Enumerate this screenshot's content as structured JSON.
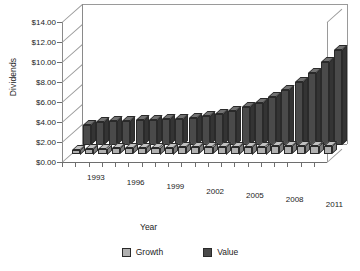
{
  "chart_data": {
    "type": "bar",
    "title": "",
    "subtitle": "",
    "xlabel": "Year",
    "ylabel": "Dividends",
    "ylim": [
      0,
      14
    ],
    "ytick_step": 2,
    "ytick_labels": [
      "$14.00",
      "$12.00",
      "$10.00",
      "$8.00",
      "$6.00",
      "$4.00",
      "$2.00",
      "$0.00"
    ],
    "ytick_values": [
      14,
      12,
      10,
      8,
      6,
      4,
      2,
      0
    ],
    "grid": false,
    "three_d": true,
    "legend_position": "bottom",
    "categories": [
      "1992",
      "1993",
      "1994",
      "1995",
      "1996",
      "1997",
      "1998",
      "1999",
      "2000",
      "2001",
      "2002",
      "2003",
      "2004",
      "2005",
      "2006",
      "2007",
      "2008",
      "2009",
      "2010",
      "2011"
    ],
    "xtick_labels_shown": [
      "1993",
      "1996",
      "1999",
      "2002",
      "2005",
      "2008",
      "2011"
    ],
    "series": [
      {
        "name": "Growth",
        "color": "#b0b0b0",
        "values": [
          0.45,
          0.55,
          0.58,
          0.6,
          0.62,
          0.64,
          0.66,
          0.68,
          0.7,
          0.72,
          0.74,
          0.76,
          0.76,
          0.78,
          0.78,
          0.8,
          0.8,
          0.8,
          0.8,
          0.82
        ]
      },
      {
        "name": "Value",
        "color": "#4a4a4a",
        "values": [
          1.95,
          2.3,
          2.35,
          2.4,
          2.45,
          2.5,
          2.55,
          2.6,
          2.7,
          2.85,
          3.1,
          3.4,
          3.75,
          4.2,
          4.8,
          5.5,
          6.3,
          7.2,
          8.3,
          9.45
        ]
      }
    ]
  },
  "legend": {
    "items": [
      {
        "label": "Growth",
        "color": "#b0b0b0"
      },
      {
        "label": "Value",
        "color": "#4a4a4a"
      }
    ]
  },
  "axes": {
    "y_title": "Dividends",
    "x_title": "Year"
  }
}
